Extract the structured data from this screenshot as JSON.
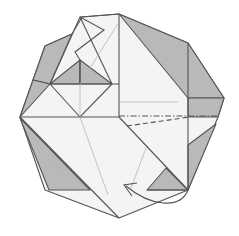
{
  "diagram": {
    "type": "origami-fold-step",
    "colors": {
      "paper_front": "#f4f4f4",
      "paper_back": "#b9b9b9",
      "line": "#555555",
      "crease": "#b5b5b5"
    },
    "fold_lines": [
      {
        "kind": "mountain-fold",
        "style": "dash-dot"
      },
      {
        "kind": "valley-fold",
        "style": "dashed"
      }
    ],
    "arrows": [
      {
        "kind": "fold-arrow",
        "direction": "curved, right-bottom to left-center"
      }
    ]
  }
}
